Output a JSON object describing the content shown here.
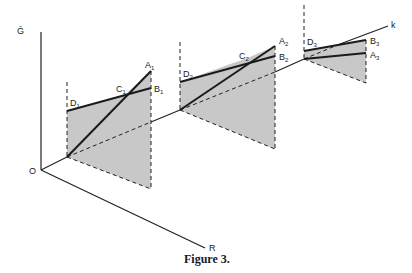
{
  "figure": {
    "caption": "Figure 3.",
    "axes": {
      "vertical": "Ḡ",
      "horizontal": "R",
      "depth": "k",
      "origin": "O"
    },
    "panels": [
      {
        "id": 1,
        "labels": {
          "D": "D",
          "D_sub": "1",
          "C": "C",
          "C_sub": "1",
          "A": "A",
          "A_sub": "1",
          "B": "B",
          "B_sub": "1"
        }
      },
      {
        "id": 2,
        "labels": {
          "D": "D",
          "D_sub": "2",
          "C": "C",
          "C_sub": "2",
          "A": "A",
          "A_sub": "2",
          "B": "B",
          "B_sub": "2"
        }
      },
      {
        "id": 3,
        "labels": {
          "D": "D",
          "D_sub": "3",
          "B": "B",
          "B_sub": "3",
          "A": "A",
          "A_sub": "3"
        }
      }
    ],
    "colors": {
      "shade": "#c8c8c8",
      "ink": "#1a1a1a",
      "background": "#ffffff"
    }
  }
}
